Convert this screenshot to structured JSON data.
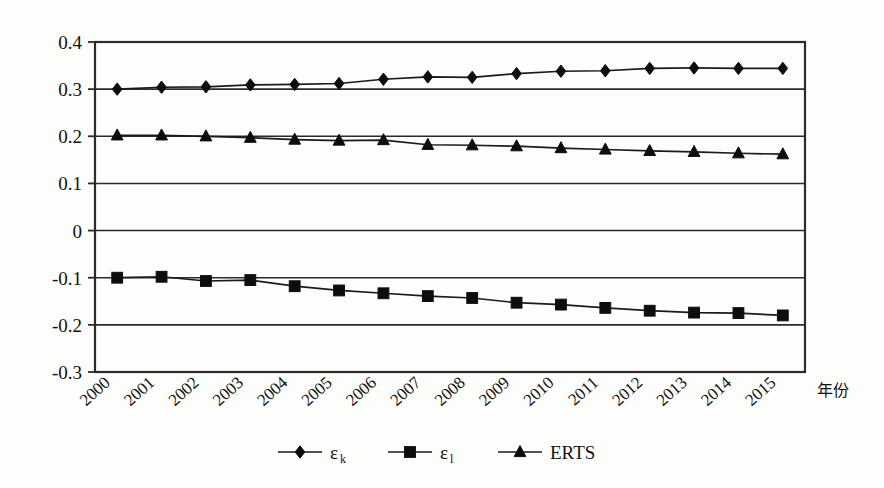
{
  "chart_data": {
    "type": "line",
    "title": "",
    "subtitle": "",
    "xlabel": "年份",
    "ylabel": "",
    "x": [
      2000,
      2001,
      2002,
      2003,
      2004,
      2005,
      2006,
      2007,
      2008,
      2009,
      2010,
      2011,
      2012,
      2013,
      2014,
      2015
    ],
    "categories": [
      "2000",
      "2001",
      "2002",
      "2003",
      "2004",
      "2005",
      "2006",
      "2007",
      "2008",
      "2009",
      "2010",
      "2011",
      "2012",
      "2013",
      "2014",
      "2015"
    ],
    "ylim": [
      -0.3,
      0.4
    ],
    "ytick_labels": [
      "0.4",
      "0.3",
      "0.2",
      "0.1",
      "0",
      "-0.1",
      "-0.2",
      "-0.3"
    ],
    "ytick_values": [
      0.4,
      0.3,
      0.2,
      0.1,
      0,
      -0.1,
      -0.2,
      -0.3
    ],
    "grid": "horizontal",
    "legend_position": "bottom",
    "series": [
      {
        "name": "εk",
        "label_base": "ε",
        "label_sub": "k",
        "marker": "diamond",
        "color": "#0d0d0d",
        "values": [
          0.3,
          0.304,
          0.305,
          0.309,
          0.31,
          0.312,
          0.321,
          0.326,
          0.325,
          0.333,
          0.338,
          0.339,
          0.344,
          0.345,
          0.344,
          0.344
        ]
      },
      {
        "name": "εl",
        "label_base": "ε",
        "label_sub": "l",
        "marker": "square",
        "color": "#0d0d0d",
        "values": [
          -0.1,
          -0.098,
          -0.107,
          -0.105,
          -0.118,
          -0.127,
          -0.133,
          -0.139,
          -0.143,
          -0.153,
          -0.157,
          -0.164,
          -0.17,
          -0.174,
          -0.175,
          -0.18
        ]
      },
      {
        "name": "ERTS",
        "label_base": "ERTS",
        "label_sub": "",
        "marker": "triangle",
        "color": "#0d0d0d",
        "values": [
          0.202,
          0.202,
          0.2,
          0.197,
          0.193,
          0.191,
          0.192,
          0.182,
          0.181,
          0.179,
          0.175,
          0.172,
          0.169,
          0.167,
          0.164,
          0.162
        ]
      }
    ]
  }
}
